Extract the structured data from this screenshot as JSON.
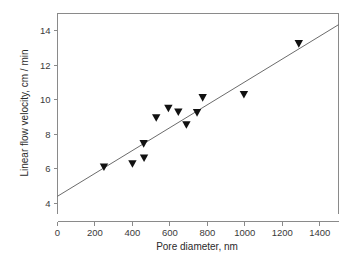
{
  "chart_data": {
    "type": "scatter",
    "title": "",
    "xlabel": "Pore diameter, nm",
    "ylabel": "Linear flow velocity, cm / min",
    "xlim": [
      0,
      1500
    ],
    "ylim": [
      3.4,
      15.0
    ],
    "xticks": [
      0,
      200,
      400,
      600,
      800,
      1000,
      1200,
      1400
    ],
    "xticklabels": [
      "0",
      "200",
      "400",
      "600",
      "800",
      "1000",
      "1200",
      "1400"
    ],
    "yticks": [
      4,
      6,
      8,
      10,
      12,
      14
    ],
    "yticklabels": [
      "4",
      "6",
      "8",
      "10",
      "12",
      "14"
    ],
    "grid": false,
    "legend": null,
    "marker": "triangle-down",
    "marker_color": "#111111",
    "points": [
      {
        "x": 248,
        "y": 6.1
      },
      {
        "x": 400,
        "y": 6.28
      },
      {
        "x": 462,
        "y": 6.62
      },
      {
        "x": 460,
        "y": 7.45
      },
      {
        "x": 527,
        "y": 8.95
      },
      {
        "x": 592,
        "y": 9.5
      },
      {
        "x": 645,
        "y": 9.28
      },
      {
        "x": 688,
        "y": 8.55
      },
      {
        "x": 745,
        "y": 9.25
      },
      {
        "x": 775,
        "y": 10.12
      },
      {
        "x": 995,
        "y": 10.3
      },
      {
        "x": 1288,
        "y": 13.25
      }
    ],
    "fit_line": {
      "x": [
        0,
        1500
      ],
      "y": [
        4.4,
        14.35
      ],
      "color": "#5a5a5a"
    }
  }
}
